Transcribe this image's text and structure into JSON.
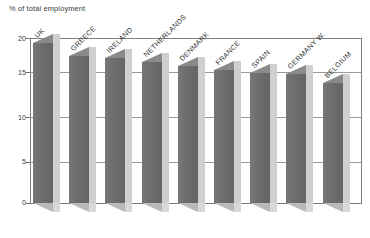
{
  "chart_data": {
    "type": "bar",
    "title": "% of total employment",
    "subtitle": "",
    "xlabel": "",
    "ylabel": "",
    "ylim": [
      0,
      20
    ],
    "yticks": [
      0,
      5,
      10,
      15,
      20
    ],
    "ytick_labels": [
      "0",
      "5",
      "10",
      "15",
      "20"
    ],
    "grid": true,
    "legend": false,
    "legend_position": "none",
    "orientation": "vertical",
    "style_3d": true,
    "categories": [
      "UK",
      "GREECE",
      "IRELAND",
      "NETHERLANDS",
      "DENMARK",
      "FRANCE",
      "SPAIN",
      "GERMANY W.",
      "BELGIUM"
    ],
    "values": [
      19.4,
      17.8,
      17.5,
      17.1,
      16.6,
      16.1,
      15.7,
      15.6,
      14.5
    ],
    "series": [
      {
        "name": "% of total employment",
        "values": [
          19.4,
          17.8,
          17.5,
          17.1,
          16.6,
          16.1,
          15.7,
          15.6,
          14.5
        ]
      }
    ],
    "colors": {
      "bar_front": "#6e6e6e",
      "bar_side": "#cfcfcf",
      "bar_top": "#8a8a8a",
      "gridline": "#9a9a9a",
      "axis": "#808080",
      "text": "#2f2f2f",
      "background": "#ffffff"
    }
  },
  "axis": {
    "y": {
      "ticks": [
        {
          "label": "20",
          "value": 20
        },
        {
          "label": "15",
          "value": 15
        },
        {
          "label": "10",
          "value": 10
        },
        {
          "label": "5",
          "value": 5
        },
        {
          "label": "0",
          "value": 0
        }
      ]
    }
  }
}
